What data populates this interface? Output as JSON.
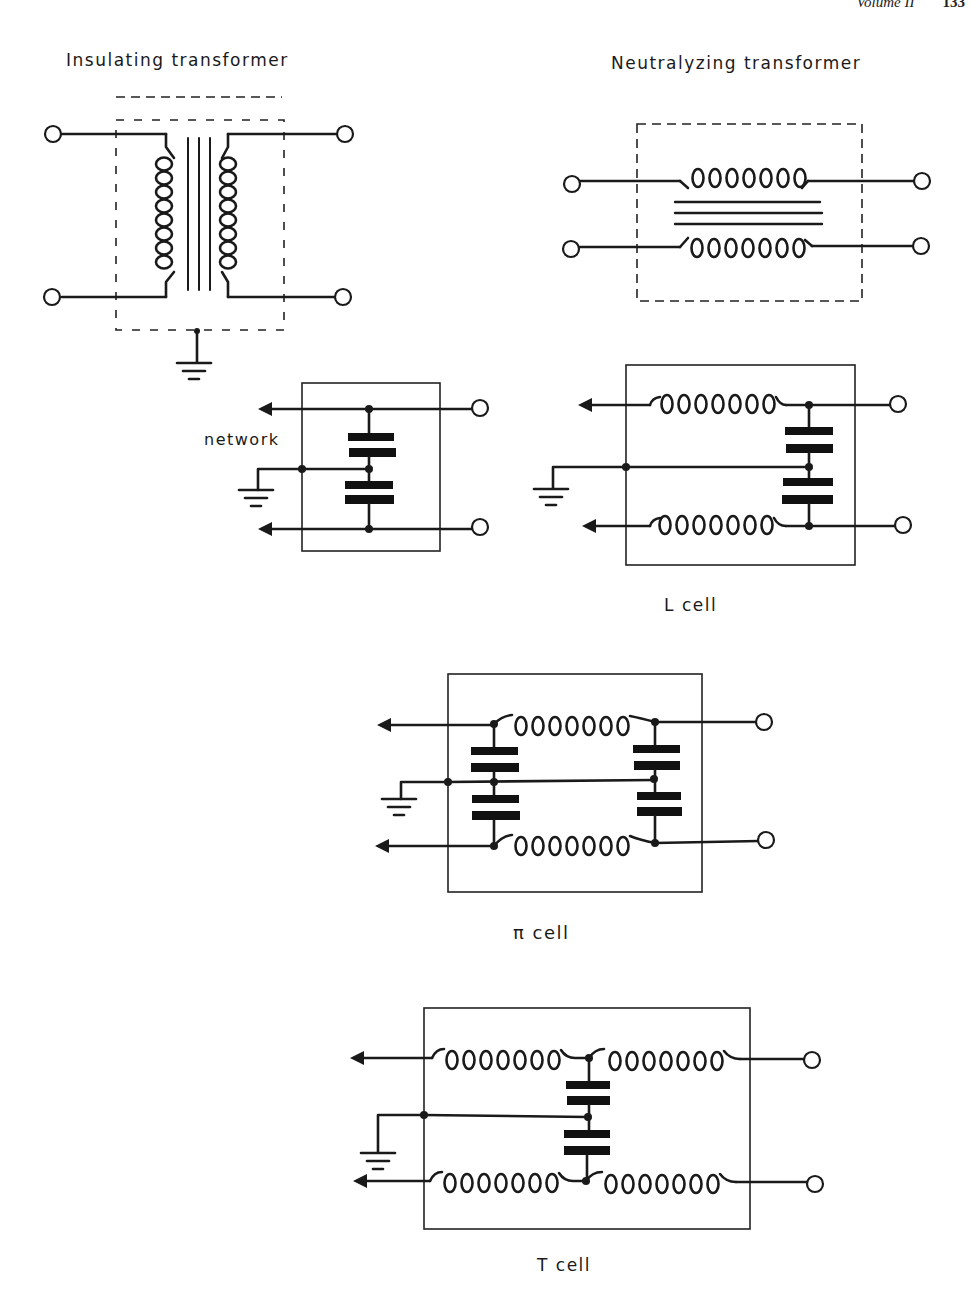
{
  "page_header": {
    "running_title": "Volume II",
    "page_number": "133"
  },
  "figures": {
    "insulating_transformer": {
      "title": "Insulating transformer"
    },
    "neutralizing_transformer": {
      "title": "Neutralyzing transformer"
    },
    "capacitor_network": {
      "label": "network"
    },
    "l_cell": {
      "caption": "L  cell"
    },
    "pi_cell": {
      "caption": "π  cell"
    },
    "t_cell": {
      "caption": "T  cell"
    }
  },
  "symbols": {
    "terminal": "open-circle",
    "ground": "ground-symbol",
    "inductor": "coil-loops",
    "capacitor": "thick-parallel-plates",
    "junction": "filled-dot",
    "signal_out": "arrowhead-left"
  }
}
